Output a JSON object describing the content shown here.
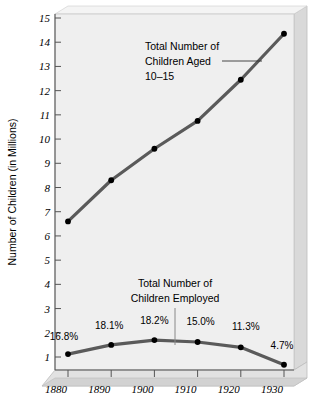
{
  "chart_data": {
    "type": "line",
    "title": "",
    "xlabel": "",
    "ylabel": "Number of Children (in Millions)",
    "x": [
      1880,
      1890,
      1900,
      1910,
      1920,
      1930
    ],
    "xtick_labels": [
      "1880",
      "1890",
      "1900",
      "1910",
      "1920",
      "1930"
    ],
    "ytick_labels": [
      "1",
      "2",
      "3",
      "4",
      "5",
      "6",
      "7",
      "8",
      "9",
      "10",
      "11",
      "12",
      "13",
      "14",
      "15"
    ],
    "ytick_values": [
      1,
      2,
      3,
      4,
      5,
      6,
      7,
      8,
      9,
      10,
      11,
      12,
      13,
      14,
      15
    ],
    "ylim": [
      0.45,
      15.35
    ],
    "grid": false,
    "legend_position": "none",
    "series": [
      {
        "name": "Total Number of Children Aged 10-15",
        "values": [
          6.6,
          8.3,
          9.6,
          10.75,
          12.45,
          14.35
        ],
        "color": "#5a5a5a",
        "marker": "circle"
      },
      {
        "name": "Total Number of Children Employed",
        "values": [
          1.12,
          1.5,
          1.7,
          1.62,
          1.4,
          0.68
        ],
        "color": "#5a5a5a",
        "marker": "circle",
        "point_labels": [
          "16.8%",
          "18.1%",
          "18.2%",
          "15.0%",
          "11.3%",
          "4.7%"
        ]
      }
    ],
    "annotations": [
      {
        "id": "upper-annotation",
        "lines": [
          "Total Number of",
          "Children Aged",
          "10–15"
        ],
        "leader": "horizontal-right"
      },
      {
        "id": "lower-annotation",
        "lines": [
          "Total Number of",
          "Children Employed"
        ],
        "leader": "vertical-down"
      }
    ]
  },
  "style": {
    "plot_background": "#efefef",
    "panel_side": "#d6d6d6",
    "panel_edge": "#b8b8b8",
    "line_color": "#5a5a5a",
    "marker_color": "#000000",
    "axis_color": "#555555",
    "text_color": "#000000"
  }
}
